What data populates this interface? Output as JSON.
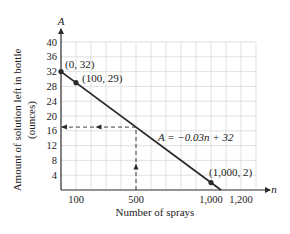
{
  "chart_data": {
    "type": "line",
    "title": "",
    "xlabel": "Number of sprays",
    "ylabel": "Amount of solution left in bottle (ounces)",
    "ylabel_line1": "Amount of solution left in bottle",
    "ylabel_line2": "(ounces)",
    "x_axis_var": "n",
    "y_axis_var": "A",
    "xlim": [
      0,
      1300
    ],
    "ylim": [
      0,
      40
    ],
    "grid": true,
    "x_grid_step": 100,
    "y_grid_step": 4,
    "x_ticks": [
      100,
      500,
      1000,
      1200
    ],
    "x_tick_labels": [
      "100",
      "500",
      "1,000",
      "1,200"
    ],
    "y_ticks": [
      4,
      8,
      12,
      16,
      20,
      24,
      28,
      32,
      36,
      40
    ],
    "y_tick_labels": [
      "4",
      "8",
      "12",
      "16",
      "20",
      "24",
      "28",
      "32",
      "36",
      "40"
    ],
    "series": [
      {
        "name": "A = -0.03n + 32",
        "equation_label": "A = −0.03n + 32",
        "slope": -0.03,
        "intercept": 32,
        "x": [
          0,
          1066.67
        ],
        "y": [
          32,
          0
        ]
      }
    ],
    "points": [
      {
        "x": 0,
        "y": 32,
        "label": "(0, 32)"
      },
      {
        "x": 100,
        "y": 29,
        "label": "(100, 29)"
      },
      {
        "x": 1000,
        "y": 2,
        "label": "(1,000, 2)"
      }
    ],
    "annotations": [
      {
        "type": "dashed-arrow-vertical",
        "from": [
          500,
          0
        ],
        "to": [
          500,
          17
        ]
      },
      {
        "type": "dashed-arrow-horizontal",
        "from": [
          500,
          17
        ],
        "to": [
          0,
          17
        ]
      }
    ],
    "legend": null
  },
  "colors": {
    "line": "#2a2a2a",
    "grid": "#d9d9d9",
    "axis": "#2a2a2a",
    "text": "#222222"
  }
}
